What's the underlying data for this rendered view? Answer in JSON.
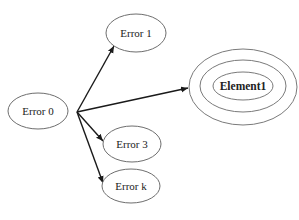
{
  "diagram": {
    "type": "directed-graph",
    "colors": {
      "background": "#ffffff",
      "node_stroke": "#6e6e6e",
      "edge": "#1a1a1a",
      "text": "#222222"
    },
    "nodes": [
      {
        "id": "error0",
        "label": "Error 0"
      },
      {
        "id": "error1",
        "label": "Error 1"
      },
      {
        "id": "element1",
        "label": "Element1",
        "style": "concentric-rings",
        "rings": 3
      },
      {
        "id": "error3",
        "label": "Error 3"
      },
      {
        "id": "errork",
        "label": "Error k"
      }
    ],
    "edges": [
      {
        "from": "error0",
        "to": "error1"
      },
      {
        "from": "error0",
        "to": "element1"
      },
      {
        "from": "error0",
        "to": "error3"
      },
      {
        "from": "error0",
        "to": "errork"
      }
    ]
  }
}
